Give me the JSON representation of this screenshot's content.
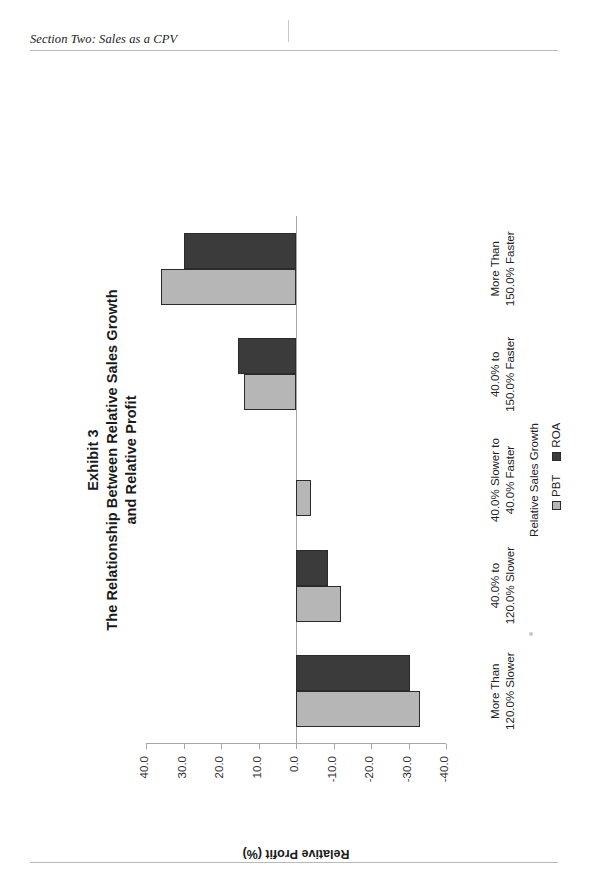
{
  "page": {
    "running_head": "Section Two:  Sales as a CPV"
  },
  "figure": {
    "exhibit_label": "Exhibit 3",
    "title_line1": "The Relationship Between Relative Sales Growth",
    "title_line2": "and Relative Profit"
  },
  "legend": {
    "items": [
      {
        "label": "PBT",
        "color": "#b6b6b6"
      },
      {
        "label": "ROA",
        "color": "#3b3b3b"
      }
    ]
  },
  "axes": {
    "value_axis_title": "Relative Profit (%)",
    "category_axis_title": "Relative Sales Growth",
    "value_ticks": [
      "40.0",
      "30.0",
      "20.0",
      "10.0",
      "0.0",
      "-10.0",
      "-20.0",
      "-30.0",
      "-40.0"
    ],
    "value_min": -40.0,
    "value_max": 40.0
  },
  "chart_data": {
    "type": "bar",
    "orientation": "horizontal-printed-sideways",
    "xlabel": "Relative Sales Growth",
    "ylabel": "Relative Profit (%)",
    "ylim": [
      -40.0,
      40.0
    ],
    "grid": false,
    "legend_position": "right",
    "categories": [
      "More Than 120.0% Slower",
      "40.0% to 120.0% Slower",
      "40.0% Slower to 40.0% Faster",
      "40.0% to 150.0% Faster",
      "More Than 150.0% Faster"
    ],
    "category_lines": [
      [
        "More Than",
        "120.0% Slower"
      ],
      [
        "40.0% to",
        "120.0% Slower"
      ],
      [
        "40.0% Slower to",
        "40.0% Faster"
      ],
      [
        "40.0% to",
        "150.0% Faster"
      ],
      [
        "More Than",
        "150.0% Faster"
      ]
    ],
    "series": [
      {
        "name": "PBT",
        "color": "#b6b6b6",
        "values": [
          -33.0,
          -12.0,
          -4.0,
          14.0,
          36.0
        ]
      },
      {
        "name": "ROA",
        "color": "#3b3b3b",
        "values": [
          -30.5,
          -8.5,
          0.0,
          15.5,
          30.0
        ]
      }
    ]
  }
}
